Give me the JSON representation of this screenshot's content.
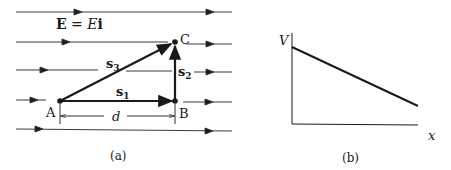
{
  "panel_a": {
    "field_label_bold_e": "E",
    "field_label_eq": " = ",
    "field_label_E": "E",
    "field_label_i": "i",
    "points": {
      "A": "A",
      "B": "B",
      "C": "C"
    },
    "vectors": {
      "s1_base": "s",
      "s1_sub": "1",
      "s2_base": "s",
      "s2_sub": "2",
      "s3_base": "s",
      "s3_sub": "3"
    },
    "distance_label": "d",
    "caption": "(a)"
  },
  "panel_b": {
    "y_axis_label": "V",
    "x_axis_label": "x",
    "caption": "(b)"
  },
  "colors": {
    "ink": "#1a1a1a",
    "line": "#3a3a3a"
  }
}
